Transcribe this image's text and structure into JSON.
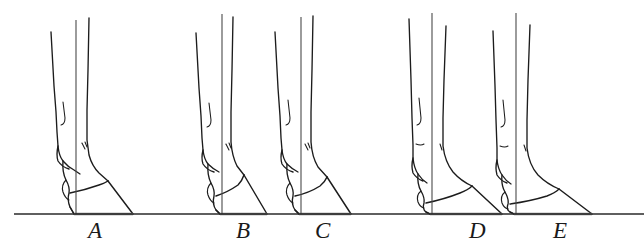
{
  "figure": {
    "style": "pen-and-ink line drawing",
    "background_color": "#ffffff",
    "ink_color": "#1c1c1c",
    "plumb_line_color": "#4a4a4a",
    "ground_line_color": "#2a2a2a",
    "sole_shadow_color": "#777777",
    "canvas": {
      "width": 644,
      "height": 246
    }
  },
  "ground": {
    "label": "ground line",
    "y": 214,
    "x_start": 14,
    "x_end": 644
  },
  "labels": [
    {
      "id": "A",
      "text": "A",
      "x": 88,
      "y": 219
    },
    {
      "id": "B",
      "text": "B",
      "x": 236,
      "y": 219
    },
    {
      "id": "C",
      "text": "C",
      "x": 315,
      "y": 219
    },
    {
      "id": "D",
      "text": "D",
      "x": 469,
      "y": 219
    },
    {
      "id": "E",
      "text": "E",
      "x": 553,
      "y": 219
    }
  ],
  "specimens": [
    {
      "id": "A",
      "name": "specimen-a",
      "label": "A",
      "plumb_x": 76,
      "hoof_toe_x": 133,
      "hoof_heel_x": 74,
      "description": "long sloping pastern with a low, forward-sloping hoof; toe extends well ahead of the plumb line"
    },
    {
      "id": "B",
      "name": "specimen-b",
      "label": "B",
      "plumb_x": 222,
      "hoof_toe_x": 267,
      "hoof_heel_x": 220,
      "description": "moderate pastern slope with a shorter, more upright hoof"
    },
    {
      "id": "C",
      "name": "specimen-c",
      "label": "C",
      "plumb_x": 301,
      "hoof_toe_x": 351,
      "hoof_heel_x": 299,
      "description": "moderate pastern with slightly longer toe than B"
    },
    {
      "id": "D",
      "name": "specimen-d",
      "label": "D",
      "plumb_x": 432,
      "hoof_toe_x": 502,
      "hoof_heel_x": 430,
      "description": "upright cannon with a long low-angled hoof and markedly forward toe"
    },
    {
      "id": "E",
      "name": "specimen-e",
      "label": "E",
      "plumb_x": 516,
      "hoof_toe_x": 592,
      "hoof_heel_x": 514,
      "description": "upright cannon with the longest, lowest-angled hoof of the series"
    }
  ]
}
